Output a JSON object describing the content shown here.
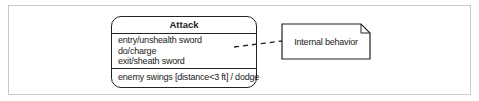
{
  "diagram": {
    "type": "uml-state",
    "state": {
      "name": "Attack",
      "internal_activities": [
        "entry/unshealth sword",
        "do/charge",
        "exit/sheath sword"
      ],
      "internal_transition": "enemy swings [distance<3 ft] / dodge"
    },
    "note": {
      "text": "Internal behavior"
    },
    "colors": {
      "stroke": "#222222",
      "frame": "#c9c9c9",
      "background": "#ffffff"
    }
  }
}
